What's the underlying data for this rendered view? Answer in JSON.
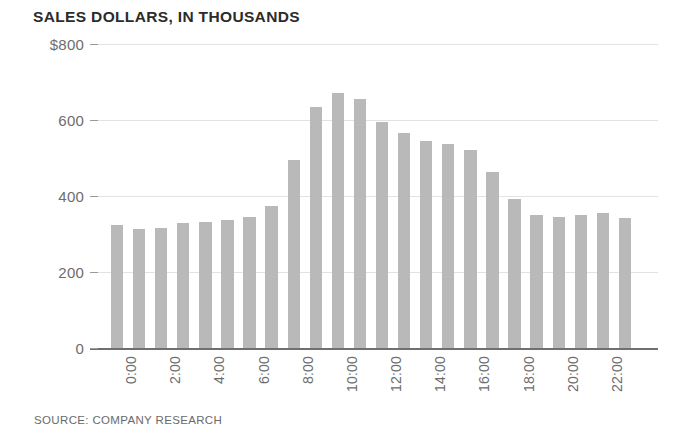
{
  "chart_data": {
    "type": "bar",
    "title": "SALES DOLLARS, IN THOUSANDS",
    "source": "SOURCE: COMPANY RESEARCH",
    "xlabel": "",
    "ylabel": "",
    "ylim": [
      0,
      800
    ],
    "grid": true,
    "legend": "none",
    "bar_color": "#b9b9b9",
    "gridline_color": "#e2e2e2",
    "axis_color": "#6f6f6f",
    "text_color": "#6d6d6d",
    "title_color": "#2b2b2b",
    "y_ticks": [
      0,
      200,
      400,
      600,
      800
    ],
    "y_tick_labels": [
      "0",
      "200",
      "400",
      "600",
      "$800"
    ],
    "x_tick_labels": [
      "0:00",
      "2:00",
      "4:00",
      "6:00",
      "8:00",
      "10:00",
      "12:00",
      "14:00",
      "16:00",
      "18:00",
      "20:00",
      "22:00"
    ],
    "x_tick_indices": [
      0,
      2,
      4,
      6,
      8,
      10,
      12,
      14,
      16,
      18,
      20,
      22
    ],
    "categories": [
      "0:00",
      "1:00",
      "2:00",
      "3:00",
      "4:00",
      "5:00",
      "6:00",
      "7:00",
      "8:00",
      "9:00",
      "10:00",
      "11:00",
      "12:00",
      "13:00",
      "14:00",
      "15:00",
      "16:00",
      "17:00",
      "18:00",
      "19:00",
      "20:00",
      "21:00",
      "22:00",
      "23:00"
    ],
    "values": [
      325,
      312,
      316,
      328,
      332,
      338,
      345,
      375,
      495,
      635,
      672,
      655,
      595,
      565,
      545,
      538,
      520,
      462,
      392,
      350,
      345,
      350,
      355,
      343
    ]
  }
}
